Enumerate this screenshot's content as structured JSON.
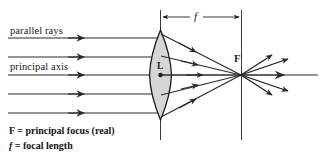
{
  "figure": {
    "title_alt": "Converging lens ray diagram",
    "colors": {
      "ink": "#1a1a1a",
      "ray": "#2b2b2b",
      "lens_fill": "#d4d4d4",
      "lens_stroke": "#1a1a1a",
      "background": "#ffffff"
    },
    "labels": {
      "parallel_rays": "parallel rays",
      "principal_axis": "principal axis",
      "focal_length_symbol": "f",
      "focus_symbol": "F",
      "lens_symbol": "L"
    },
    "caption": {
      "line1_symbol": "F",
      "line1_text": " = principal focus (real)",
      "line2_symbol": "f",
      "line2_text": " = focal length"
    },
    "geometry": {
      "lens_x": 160,
      "lens_center_y": 75,
      "lens_half_height": 45,
      "lens_width": 22,
      "focus_x": 241,
      "focus_y": 75,
      "dimension_line_y": 17,
      "ray_ys": [
        38,
        57,
        75,
        94,
        113
      ],
      "ray_start_x": 8,
      "incoming_arrow_x": 83,
      "axis_end_x": 318,
      "vertical_line_top": 10,
      "vertical_line_bottom": 140,
      "focus_line_top": 10,
      "focus_line_bottom": 140
    }
  }
}
